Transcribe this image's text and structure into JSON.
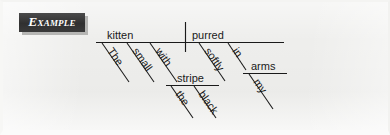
{
  "page": {
    "background_color": "#eeeeec",
    "ink_color": "#1a1a1a"
  },
  "badge": {
    "label": "Example",
    "background_color": "#3b3b3b",
    "text_color": "#ffffff",
    "shadow_color": "#b6b6b4"
  },
  "diagram": {
    "type": "reed-kellogg-sentence-diagram",
    "sentence": "The small kitten with the black stripe purred softly in my arms.",
    "nodes": {
      "subject": "kitten",
      "verb": "purred",
      "subject_modifiers": [
        "The",
        "small"
      ],
      "subject_prepositional_phrase": {
        "preposition": "with",
        "object": "stripe",
        "object_modifiers": [
          "the",
          "black"
        ]
      },
      "verb_modifiers": [
        "softly"
      ],
      "verb_prepositional_phrase": {
        "preposition": "in",
        "object": "arms",
        "object_modifiers": [
          "my"
        ]
      }
    },
    "labels": {
      "kitten": "kitten",
      "purred": "purred",
      "the": "The",
      "small": "small",
      "with": "with",
      "stripe": "stripe",
      "the2": "the",
      "black": "black",
      "softly": "softly",
      "in": "in",
      "arms": "arms",
      "my": "my"
    }
  }
}
